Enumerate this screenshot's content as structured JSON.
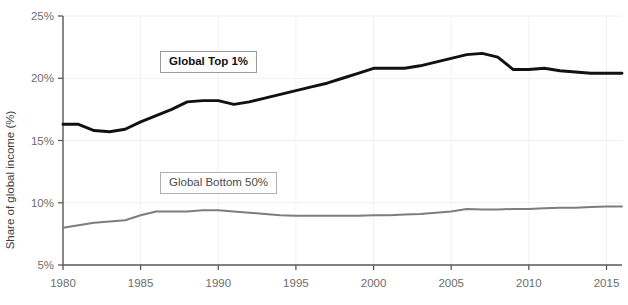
{
  "chart_data": {
    "type": "line",
    "title": "",
    "xlabel": "",
    "ylabel": "Share of global income (%)",
    "xlim": [
      1980,
      2016
    ],
    "ylim": [
      5,
      25
    ],
    "ytick_labels": [
      "5%",
      "10%",
      "15%",
      "20%",
      "25%"
    ],
    "ytick_values": [
      5,
      10,
      15,
      20,
      25
    ],
    "xtick_labels": [
      "1980",
      "1985",
      "1990",
      "1995",
      "2000",
      "2005",
      "2010",
      "2015"
    ],
    "xtick_values": [
      1980,
      1985,
      1990,
      1995,
      2000,
      2005,
      2010,
      2015
    ],
    "grid": true,
    "legend_position": "inside-plot",
    "x": [
      1980,
      1981,
      1982,
      1983,
      1984,
      1985,
      1986,
      1987,
      1988,
      1989,
      1990,
      1991,
      1992,
      1993,
      1994,
      1995,
      1996,
      1997,
      1998,
      1999,
      2000,
      2001,
      2002,
      2003,
      2004,
      2005,
      2006,
      2007,
      2008,
      2009,
      2010,
      2011,
      2012,
      2013,
      2014,
      2015,
      2016
    ],
    "series": [
      {
        "name": "Global Top 1%",
        "color": "#111111",
        "values": [
          16.3,
          16.3,
          15.8,
          15.7,
          15.9,
          16.5,
          17.0,
          17.5,
          18.1,
          18.2,
          18.2,
          17.9,
          18.1,
          18.4,
          18.7,
          19.0,
          19.3,
          19.6,
          20.0,
          20.4,
          20.8,
          20.8,
          20.8,
          21.0,
          21.3,
          21.6,
          21.9,
          22.0,
          21.7,
          20.7,
          20.7,
          20.8,
          20.6,
          20.5,
          20.4,
          20.4,
          20.4
        ]
      },
      {
        "name": "Global Bottom 50%",
        "color": "#7d7d7d",
        "values": [
          8.0,
          8.2,
          8.4,
          8.5,
          8.6,
          9.0,
          9.3,
          9.3,
          9.3,
          9.4,
          9.4,
          9.3,
          9.2,
          9.1,
          9.0,
          8.95,
          8.95,
          8.95,
          8.95,
          8.95,
          9.0,
          9.0,
          9.05,
          9.1,
          9.2,
          9.3,
          9.5,
          9.45,
          9.45,
          9.5,
          9.5,
          9.55,
          9.6,
          9.6,
          9.65,
          9.7,
          9.7
        ]
      }
    ],
    "legend_entries": [
      {
        "label": "Global Top 1%"
      },
      {
        "label": "Global Bottom 50%"
      }
    ]
  }
}
